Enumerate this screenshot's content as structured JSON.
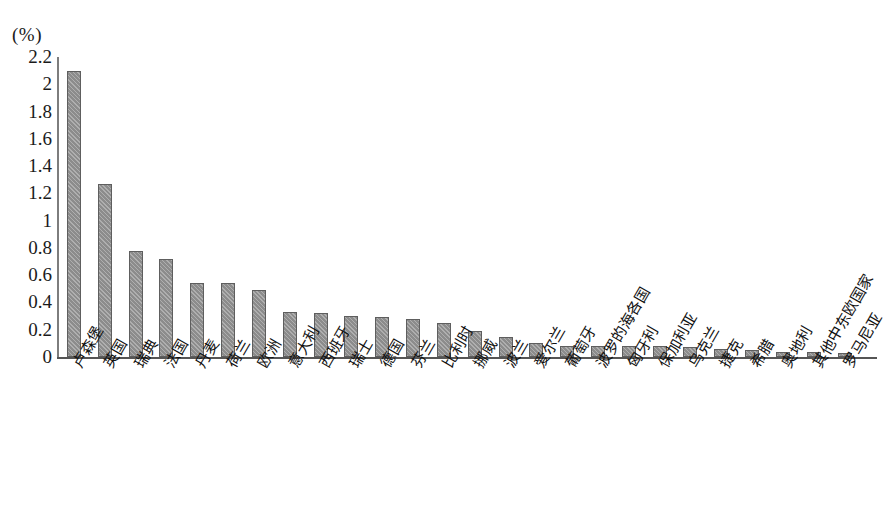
{
  "chart_data": {
    "type": "bar",
    "title": "",
    "subtitle": "",
    "xlabel": "",
    "ylabel": "(%)",
    "unit_label": "(%)",
    "ylim": [
      0,
      2.2
    ],
    "y_ticks": [
      "2.2",
      "2",
      "1.8",
      "1.6",
      "1.4",
      "1.2",
      "1",
      "0.8",
      "0.6",
      "0.4",
      "0.2",
      "0"
    ],
    "y_tick_values": [
      2.2,
      2.0,
      1.8,
      1.6,
      1.4,
      1.2,
      1.0,
      0.8,
      0.6,
      0.4,
      0.2,
      0
    ],
    "grid": false,
    "legend": null,
    "legend_position": "none",
    "bar_color": "#8c8c8c",
    "bar_edge_color": "#5e5e5e",
    "axis_color": "#555555",
    "background_color": "#ffffff",
    "categories": [
      "卢森堡",
      "英国",
      "瑞典",
      "法国",
      "丹麦",
      "荷兰",
      "欧洲",
      "意大利",
      "西班牙",
      "瑞士",
      "德国",
      "芬兰",
      "比利时",
      "挪威",
      "波兰",
      "爱尔兰",
      "葡萄牙",
      "波罗的海各国",
      "匈牙利",
      "保加利亚",
      "乌克兰",
      "捷克",
      "希腊",
      "奥地利",
      "其他中东欧国家",
      "罗马尼亚"
    ],
    "values": [
      2.1,
      1.27,
      0.78,
      0.72,
      0.54,
      0.54,
      0.49,
      0.33,
      0.32,
      0.3,
      0.29,
      0.28,
      0.25,
      0.19,
      0.15,
      0.1,
      0.08,
      0.08,
      0.08,
      0.08,
      0.07,
      0.06,
      0.05,
      0.04,
      0.04,
      0.03
    ],
    "series": [
      {
        "name": "",
        "values": [
          2.1,
          1.27,
          0.78,
          0.72,
          0.54,
          0.54,
          0.49,
          0.33,
          0.32,
          0.3,
          0.29,
          0.28,
          0.25,
          0.19,
          0.15,
          0.1,
          0.08,
          0.08,
          0.08,
          0.08,
          0.07,
          0.06,
          0.05,
          0.04,
          0.04,
          0.03
        ]
      }
    ]
  }
}
